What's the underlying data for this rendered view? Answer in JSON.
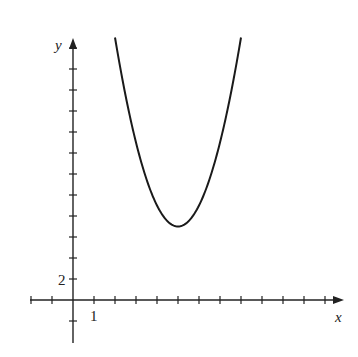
{
  "chart_data": {
    "type": "line",
    "title": "",
    "xlabel": "x",
    "ylabel": "y",
    "function": "y = 2(x - 5)^2 + 7",
    "vertex": [
      5,
      7
    ],
    "x_tick_step": 1,
    "y_tick_step": 2,
    "x_tick_labels": [
      {
        "value": 1,
        "label": "1"
      }
    ],
    "y_tick_labels": [
      {
        "value": 2,
        "label": "2"
      }
    ],
    "xlim": [
      -2,
      13
    ],
    "ylim": [
      -4,
      28
    ],
    "grid": false,
    "series": [
      {
        "name": "curve",
        "x": [
          2,
          2.5,
          3,
          3.5,
          4,
          4.5,
          5,
          5.5,
          6,
          6.5,
          7,
          7.5,
          8
        ],
        "y": [
          25,
          19.5,
          15,
          11.5,
          9,
          7.5,
          7,
          7.5,
          9,
          11.5,
          15,
          19.5,
          25
        ]
      }
    ]
  },
  "axes": {
    "x_label": "x",
    "y_label": "y",
    "x_tick_label": "1",
    "y_tick_label": "2"
  },
  "colors": {
    "axis": "#222222",
    "curve": "#1a1a1a"
  }
}
